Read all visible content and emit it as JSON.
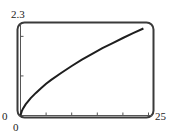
{
  "chart_data": {
    "type": "line",
    "title": "",
    "xlabel": "",
    "ylabel": "",
    "xlim": [
      0,
      25
    ],
    "ylim": [
      0,
      2.3
    ],
    "x_tick_labels": {
      "min": "0",
      "max": "25"
    },
    "y_tick_labels": {
      "min": "0",
      "max": "2.3"
    },
    "x_ticks": [
      5,
      10,
      15,
      20,
      25
    ],
    "y_ticks": [
      1,
      2
    ],
    "grid": false,
    "legend": null,
    "series": [
      {
        "name": "curve",
        "x": [
          0,
          0.25,
          0.5,
          1,
          2,
          3,
          4,
          5,
          6,
          8,
          10,
          12,
          14,
          16,
          18,
          20,
          22,
          24
        ],
        "y": [
          0,
          0.11,
          0.18,
          0.28,
          0.44,
          0.57,
          0.69,
          0.8,
          0.9,
          1.08,
          1.25,
          1.41,
          1.56,
          1.7,
          1.83,
          1.96,
          2.08,
          2.2
        ]
      }
    ]
  },
  "labels": {
    "ymax": "2.3",
    "ymin": "0",
    "xmin": "0",
    "xmax": "25"
  },
  "colors": {
    "frame": "#3a3a3a",
    "curve": "#1e1e1e",
    "axis": "#555555"
  }
}
